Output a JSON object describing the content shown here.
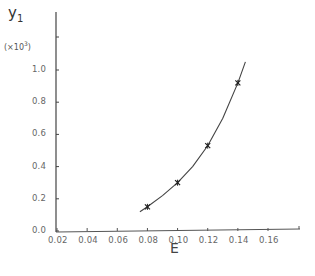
{
  "chart_data": {
    "type": "line",
    "title": "",
    "xlabel": "E",
    "ylabel": "y1",
    "ylabel_scale": "(×10³)",
    "xlim": [
      0.02,
      0.18
    ],
    "ylim": [
      0.0,
      1.2
    ],
    "x_ticks": [
      "0.02",
      "0.04",
      "0.06",
      "0.08",
      "0.10",
      "0.12",
      "0.14",
      "0.16"
    ],
    "y_ticks": [
      "0.0",
      "0.2",
      "0.4",
      "0.6",
      "0.8",
      "1.0"
    ],
    "grid": false,
    "legend": null,
    "series": [
      {
        "name": "measured",
        "marker": "asterisk",
        "x": [
          0.08,
          0.1,
          0.12,
          0.14
        ],
        "y": [
          0.15,
          0.3,
          0.53,
          0.92
        ]
      },
      {
        "name": "fitted curve",
        "style": "smooth line",
        "x": [
          0.075,
          0.08,
          0.09,
          0.1,
          0.11,
          0.12,
          0.13,
          0.14,
          0.145
        ],
        "y": [
          0.12,
          0.15,
          0.22,
          0.3,
          0.4,
          0.53,
          0.7,
          0.92,
          1.05
        ]
      }
    ]
  },
  "labels": {
    "y_title": "y",
    "y_sub": "1",
    "y_scale_prefix": "(×10",
    "y_scale_exp": "3",
    "y_scale_suffix": ")",
    "x_title": "E"
  }
}
